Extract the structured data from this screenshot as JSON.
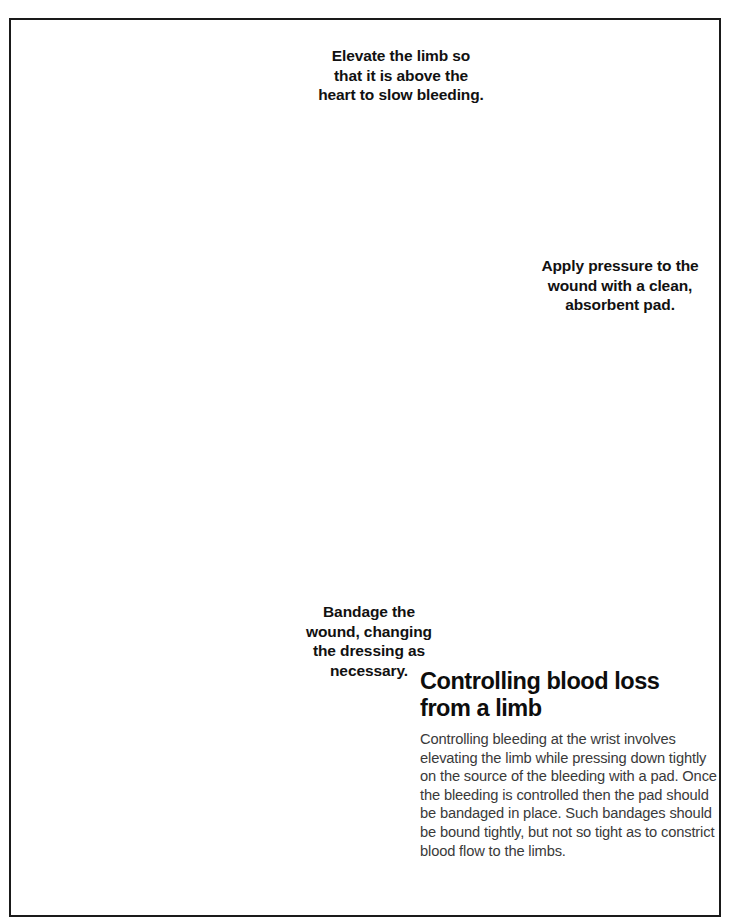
{
  "document": {
    "type": "first-aid instructional illustration",
    "frame_color": "#1a1a1a",
    "background_color": "#ffffff"
  },
  "captions": {
    "elevate": "Elevate the limb so\nthat it is above the\nheart to slow bleeding.",
    "pressure": "Apply pressure to the\nwound with a clean,\nabsorbent pad.",
    "bandage": "Bandage the\nwound, changing\nthe dressing as\nnecessary."
  },
  "article": {
    "title": "Controlling blood loss\nfrom a limb",
    "body": "Controlling bleeding at the wrist involves elevating the limb while pressing down tightly on the source of the bleeding with a pad. Once the bleeding is controlled then the pad should be bandaged in place. Such bandages should be bound tightly, but not so tight as to constrict blood flow to the limbs.",
    "title_color": "#0d0d0d",
    "body_color": "#3a3a3a"
  },
  "illustration": {
    "style": "grayscale pen-and-ink with pencil shading",
    "scenes": [
      {
        "name": "kneeling-rescuer",
        "description": "A rescuer kneeling, head bowed, holding the casualty's raised forearm with both hands"
      },
      {
        "name": "casualty-lying",
        "description": "The casualty lying supine on the ground, head turned, arm raised"
      },
      {
        "name": "pressure-on-wound",
        "description": "Close-up of a hand pressing an absorbent pad onto the bleeding wrist of a raised arm"
      },
      {
        "name": "bandaging-wrist",
        "description": "Close-up of two hands winding a roller bandage around the casualty's wrist"
      }
    ],
    "palette": {
      "ink": "#1b1b1b",
      "skin": "#fdfdfd",
      "shirt_gray": "#8b8b8b",
      "trouser_gray": "#b9b9b9",
      "hair_dark": "#4a4a4a",
      "deep_shadow": "#3b3b3b"
    }
  }
}
